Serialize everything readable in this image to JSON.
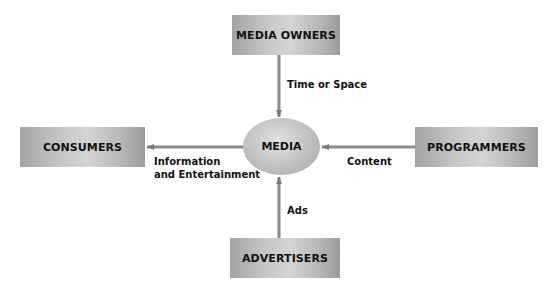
{
  "diagram": {
    "center": {
      "label": "MEDIA"
    },
    "nodes": {
      "top": {
        "label": "MEDIA OWNERS"
      },
      "left": {
        "label": "CONSUMERS"
      },
      "right": {
        "label": "PROGRAMMERS"
      },
      "bottom": {
        "label": "ADVERTISERS"
      }
    },
    "edges": {
      "owners_to_media": {
        "label": "Time or Space"
      },
      "media_to_consumers": {
        "label_line1": "Information",
        "label_line2": "and Entertainment"
      },
      "programmers_to_media": {
        "label": "Content"
      },
      "advertisers_to_media": {
        "label": "Ads"
      }
    },
    "colors": {
      "arrow": "#7a7a7a",
      "box_gray": "#c0c0c0",
      "text": "#111111",
      "background": "#ffffff"
    }
  }
}
